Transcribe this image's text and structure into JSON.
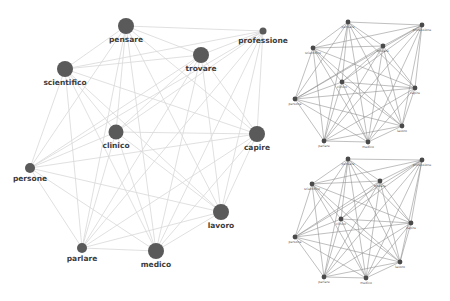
{
  "colors": {
    "background": "#ffffff",
    "node_fill": "#5a5a5a",
    "node_label": "#3c3c3c",
    "main_edge": "#d8d8d8",
    "mini_edge": "#8a8a8a",
    "mini_node": "#4a4a4a"
  },
  "main_graph": {
    "nodes": [
      {
        "id": "pensare",
        "label": "pensare",
        "x": 126,
        "y": 26,
        "r": 8
      },
      {
        "id": "professione",
        "label": "professione",
        "x": 263,
        "y": 31,
        "r": 3.5
      },
      {
        "id": "trovare",
        "label": "trovare",
        "x": 201,
        "y": 55,
        "r": 8
      },
      {
        "id": "scientifico",
        "label": "scientifico",
        "x": 65,
        "y": 69,
        "r": 8
      },
      {
        "id": "clinico",
        "label": "clinico",
        "x": 116,
        "y": 132,
        "r": 7.5
      },
      {
        "id": "capire",
        "label": "capire",
        "x": 257,
        "y": 134,
        "r": 8
      },
      {
        "id": "persone",
        "label": "persone",
        "x": 30,
        "y": 168,
        "r": 5
      },
      {
        "id": "lavoro",
        "label": "lavoro",
        "x": 221,
        "y": 212,
        "r": 8
      },
      {
        "id": "parlare",
        "label": "parlare",
        "x": 82,
        "y": 248,
        "r": 5
      },
      {
        "id": "medico",
        "label": "medico",
        "x": 156,
        "y": 251,
        "r": 8
      }
    ],
    "edges": "complete"
  },
  "mini_graphs": [
    {
      "id": "top",
      "nodes": [
        {
          "id": "pensare",
          "label": "pensare",
          "x": 348,
          "y": 22
        },
        {
          "id": "professione",
          "label": "professione",
          "x": 422,
          "y": 25
        },
        {
          "id": "trovare",
          "label": "trovare",
          "x": 383,
          "y": 46
        },
        {
          "id": "scientifico",
          "label": "scientifico",
          "x": 313,
          "y": 48
        },
        {
          "id": "clinico",
          "label": "clinico",
          "x": 342,
          "y": 82
        },
        {
          "id": "capire",
          "label": "capire",
          "x": 415,
          "y": 88
        },
        {
          "id": "persone",
          "label": "persone",
          "x": 295,
          "y": 99
        },
        {
          "id": "lavoro",
          "label": "lavoro",
          "x": 402,
          "y": 126
        },
        {
          "id": "parlare",
          "label": "parlare",
          "x": 324,
          "y": 141
        },
        {
          "id": "medico",
          "label": "medico",
          "x": 368,
          "y": 142
        }
      ]
    },
    {
      "id": "bottom",
      "nodes": [
        {
          "id": "pensare",
          "label": "pensare",
          "x": 348,
          "y": 159
        },
        {
          "id": "professione",
          "label": "professione",
          "x": 422,
          "y": 160
        },
        {
          "id": "trovare",
          "label": "trovare",
          "x": 380,
          "y": 181
        },
        {
          "id": "scientifico",
          "label": "scientifico",
          "x": 312,
          "y": 184
        },
        {
          "id": "clinico",
          "label": "clinico",
          "x": 341,
          "y": 219
        },
        {
          "id": "capire",
          "label": "capire",
          "x": 411,
          "y": 223
        },
        {
          "id": "persone",
          "label": "persone",
          "x": 295,
          "y": 237
        },
        {
          "id": "lavoro",
          "label": "lavoro",
          "x": 400,
          "y": 262
        },
        {
          "id": "parlare",
          "label": "parlare",
          "x": 324,
          "y": 277
        },
        {
          "id": "medico",
          "label": "medico",
          "x": 366,
          "y": 278
        }
      ]
    }
  ]
}
